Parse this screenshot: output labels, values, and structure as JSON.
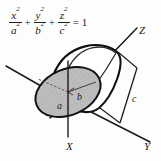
{
  "figure": {
    "kind": "ellipsoid-diagram",
    "equation": {
      "term1": {
        "numerator": "x",
        "numerator_exp": "2",
        "denominator": "a",
        "denominator_exp": "2"
      },
      "plus1": "+",
      "term2": {
        "numerator": "y",
        "numerator_exp": "2",
        "denominator": "b",
        "denominator_exp": "2"
      },
      "plus2": "+",
      "term3": {
        "numerator": "z",
        "numerator_exp": "2",
        "denominator": "c",
        "denominator_exp": "2"
      },
      "equals": "= 1"
    },
    "axes": [
      {
        "id": "z",
        "label": "Z"
      },
      {
        "id": "x",
        "label": "X"
      },
      {
        "id": "y",
        "label": "Y"
      }
    ],
    "dimensions": [
      {
        "id": "a",
        "label": "a"
      },
      {
        "id": "b",
        "label": "b"
      },
      {
        "id": "c",
        "label": "c"
      }
    ],
    "colors": {
      "ink": "#1a1a1a",
      "outline": "#111111",
      "shading": "#b9b9b9",
      "thin_line": "#4a4a4a",
      "background": "#fdfdfd"
    }
  }
}
